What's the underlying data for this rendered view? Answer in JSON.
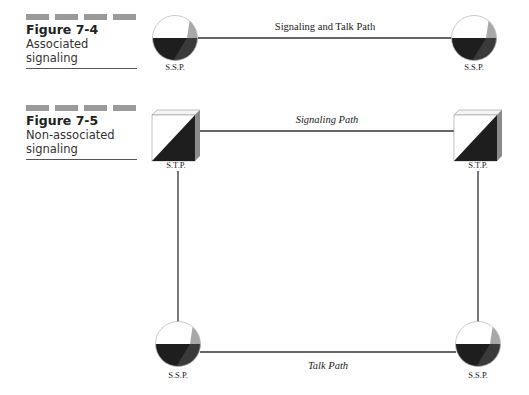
{
  "figure_7_4": {
    "number": "Figure 7-4",
    "title": "Associated signaling",
    "path_label": "Signaling and Talk Path",
    "nodes": [
      {
        "type": "SSP",
        "label": "S.S.P.",
        "x": 175,
        "y": 38
      },
      {
        "type": "SSP",
        "label": "S.S.P.",
        "x": 474,
        "y": 38
      }
    ]
  },
  "figure_7_5": {
    "number": "Figure 7-5",
    "title_line1": "Non-associated",
    "title_line2": "signaling",
    "signaling_path_label": "Signaling Path",
    "talk_path_label": "Talk Path",
    "nodes": [
      {
        "type": "STP",
        "label": "S.T.P.",
        "position": "top-left"
      },
      {
        "type": "STP",
        "label": "S.T.P.",
        "position": "top-right"
      },
      {
        "type": "SSP",
        "label": "S.S.P.",
        "position": "bottom-left"
      },
      {
        "type": "SSP",
        "label": "S.S.P.",
        "position": "bottom-right"
      }
    ]
  },
  "colors": {
    "line": "#333333",
    "dark_fill": "#1e1e1e",
    "grey_accent": "#a8a8a8",
    "bar": "#9a9a9a"
  }
}
